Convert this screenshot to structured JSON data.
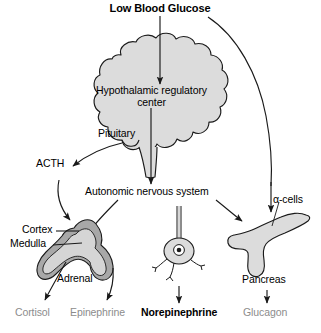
{
  "figure": {
    "domain": "biology-flow-diagram",
    "title": "Low Blood Glucose",
    "colors": {
      "organ_fill": "#dcdcdc",
      "organ_stroke": "#1a1a1a",
      "cortex_fill": "#a8a8a8",
      "medulla_fill": "#d5d5d5",
      "arrow": "#1a1a1a",
      "product_gray": "#8c8c8c",
      "product_black": "#000000",
      "background": "#ffffff"
    }
  },
  "nodes": {
    "stimulus": "Low Blood Glucose",
    "hypothalamus_line1": "Hypothalamic regulatory",
    "hypothalamus_line2": "center",
    "pituitary": "Pituitary",
    "acth": "ACTH",
    "ans": "Autonomic nervous system",
    "cortex": "Cortex",
    "medulla": "Medulla",
    "adrenal": "Adrenal",
    "alpha_cells": "α-cells",
    "pancreas": "Pancreas"
  },
  "products": [
    {
      "label": "Cortisol",
      "style": "gray"
    },
    {
      "label": "Epinephrine",
      "style": "gray"
    },
    {
      "label": "Norepinephrine",
      "style": "black"
    },
    {
      "label": "Glucagon",
      "style": "gray"
    }
  ],
  "caption": ""
}
